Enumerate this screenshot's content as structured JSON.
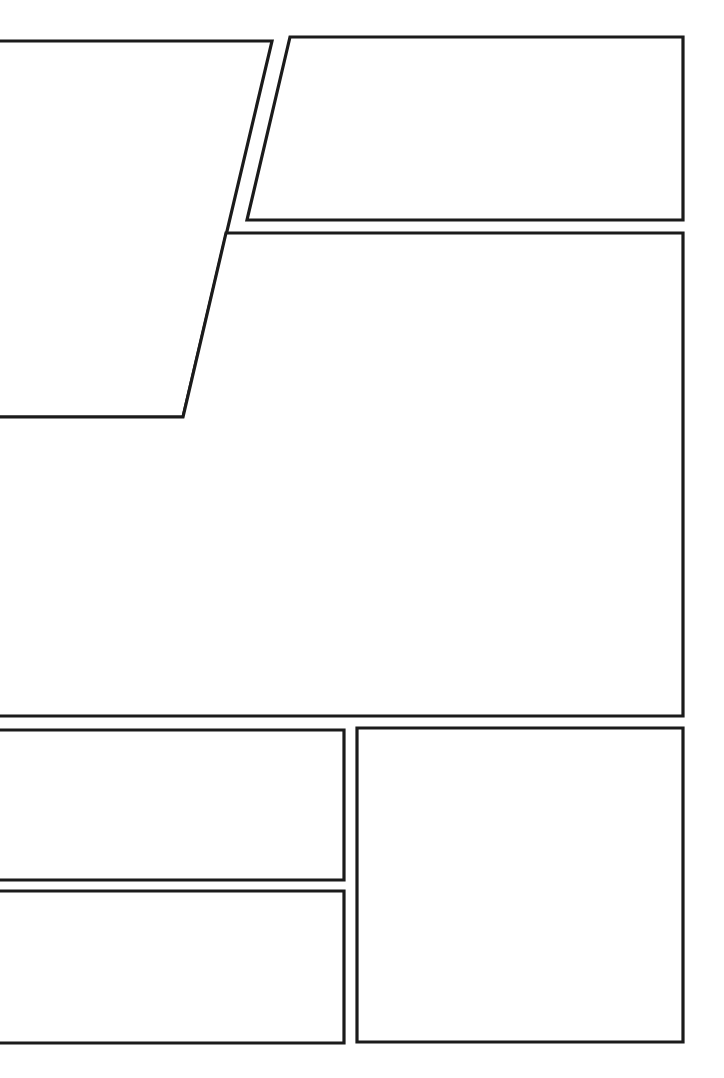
{
  "page": {
    "width": 724,
    "height": 1078,
    "background_color": "#ffffff",
    "border_color": "#1b1b1b",
    "border_width": 3,
    "panel_count": 6,
    "content_text": ""
  },
  "panels": [
    {
      "id": "panel-1",
      "label": "Panel 1",
      "position": "top-left",
      "shape": "quadrilateral",
      "bleed": "left",
      "points": "-12,41 272,41 183,417 -12,417",
      "content_text": ""
    },
    {
      "id": "panel-2",
      "label": "Panel 2",
      "position": "top-right",
      "shape": "quadrilateral",
      "bleed": "none",
      "points": "290,37 683,37 683,220 247,220",
      "content_text": ""
    },
    {
      "id": "panel-3",
      "label": "Panel 3",
      "position": "middle-wide",
      "shape": "quadrilateral",
      "bleed": "left",
      "points": "226,233 683,233 683,716 -12,716 -12,417 183,417",
      "content_text": ""
    },
    {
      "id": "panel-4",
      "label": "Panel 4",
      "position": "lower-left-upper",
      "shape": "rectangle",
      "bleed": "left",
      "points": "-12,730 344,730 344,880 -12,880",
      "content_text": ""
    },
    {
      "id": "panel-5",
      "label": "Panel 5",
      "position": "lower-left-lower",
      "shape": "rectangle",
      "bleed": "left",
      "points": "-12,891 344,891 344,1043 -12,1043",
      "content_text": ""
    },
    {
      "id": "panel-6",
      "label": "Panel 6",
      "position": "lower-right",
      "shape": "rectangle",
      "bleed": "none",
      "points": "357,728 683,728 683,1042 357,1042",
      "content_text": ""
    }
  ]
}
